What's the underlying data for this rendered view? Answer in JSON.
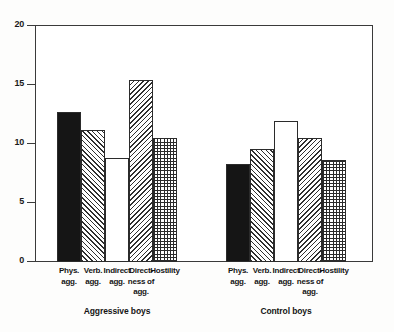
{
  "chart_data": {
    "type": "bar",
    "title": "",
    "subtitle": "",
    "xlabel": "",
    "ylabel": "",
    "ylim": [
      0,
      20
    ],
    "yticks": [
      0,
      5,
      10,
      15,
      20
    ],
    "ytick_labels": [
      "0",
      "5",
      "10",
      "15",
      "20"
    ],
    "grid": false,
    "legend": "none",
    "categories": [
      "Phys. agg.",
      "Verb. agg.",
      "Indirect agg.",
      "Direct-ness of agg.",
      "Hostility"
    ],
    "category_lines": [
      [
        "Phys.",
        "agg."
      ],
      [
        "Verb.",
        "agg."
      ],
      [
        "Indirect",
        "agg."
      ],
      [
        "Direct-",
        "ness of",
        "agg."
      ],
      [
        "Hostility"
      ]
    ],
    "groups": [
      {
        "name": "Aggressive boys",
        "values": [
          12.7,
          11.1,
          8.8,
          15.4,
          10.5
        ]
      },
      {
        "name": "Control boys",
        "values": [
          8.3,
          9.5,
          11.9,
          10.5,
          8.6
        ]
      }
    ],
    "bar_fills": [
      "solid-black",
      "hatch-right",
      "white",
      "hatch-left",
      "grid-checker"
    ],
    "colors": {
      "bar_outline": "#2b2b2b",
      "solid_bar": "#151515",
      "axis": "#3a3a3a",
      "background": "#ffffff",
      "text": "#151515"
    }
  }
}
